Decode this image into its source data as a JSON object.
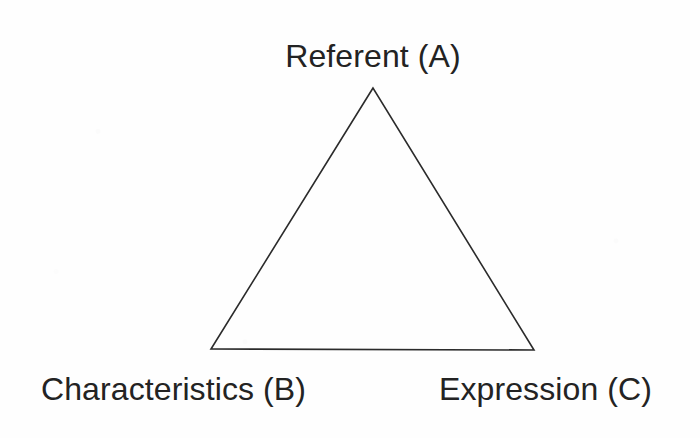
{
  "figure": {
    "kind": "triangle-diagram",
    "background_color": "#ffffff",
    "stroke_color": "#2b2b2b",
    "text_color": "#232323"
  },
  "diagram": {
    "shape": "triangle",
    "vertices": [
      {
        "id": "A",
        "name": "apex-vertex",
        "x": 373,
        "y": 88,
        "label_key": "referent"
      },
      {
        "id": "B",
        "name": "bottom-left-vertex",
        "x": 211,
        "y": 349,
        "label_key": "characteristics"
      },
      {
        "id": "C",
        "name": "bottom-right-vertex",
        "x": 534,
        "y": 350,
        "label_key": "expression"
      }
    ],
    "edges": [
      {
        "from": "A",
        "to": "B"
      },
      {
        "from": "B",
        "to": "C"
      },
      {
        "from": "C",
        "to": "A"
      }
    ],
    "stroke_width": 1.6
  },
  "labels": {
    "referent": "Referent (A)",
    "characteristics": "Characteristics (B)",
    "expression": "Expression (C)"
  }
}
